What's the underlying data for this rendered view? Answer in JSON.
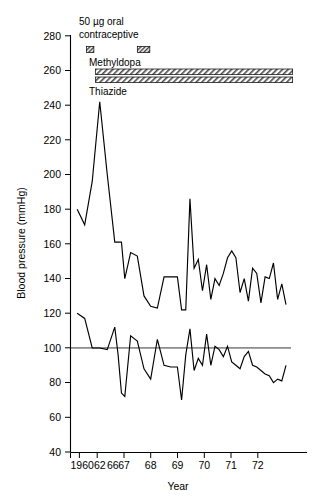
{
  "chart_data": {
    "type": "line",
    "title": "",
    "xlabel": "Year",
    "ylabel": "Blood pressure (mmHg)",
    "ylim": [
      40,
      280
    ],
    "ytick_step": 20,
    "yticks": [
      40,
      60,
      80,
      100,
      120,
      140,
      160,
      180,
      200,
      220,
      240,
      260,
      280
    ],
    "ytick_labels": [
      "40",
      "60",
      "80",
      "100",
      "120",
      "140",
      "160",
      "180",
      "200",
      "220",
      "240",
      "260",
      "280"
    ],
    "xticks": [
      1960,
      1962,
      1966,
      1967,
      1968,
      1969,
      1970,
      1971,
      1972
    ],
    "xtick_labels": [
      "1960",
      "62",
      "66",
      "67",
      "68",
      "69",
      "70",
      "71",
      "72"
    ],
    "xlim": [
      1959.6,
      1972.8
    ],
    "grid": false,
    "legend_position": "none",
    "reference_lines": [
      {
        "name": "diastolic-target",
        "y": 100,
        "label": ""
      }
    ],
    "series": [
      {
        "name": "Systolic blood pressure",
        "x": [
          1960.0,
          1960.45,
          1960.9,
          1961.35,
          1961.8,
          1962.25,
          1962.45,
          1962.65,
          1962.85,
          1963.2,
          1963.6,
          1964.0,
          1964.4,
          1964.8,
          1965.2,
          1965.6,
          1966.0,
          1966.25,
          1966.5,
          1966.75,
          1967.0,
          1967.25,
          1967.5,
          1967.75,
          1968.0,
          1968.25,
          1968.5,
          1968.75,
          1969.0,
          1969.25,
          1969.5,
          1969.75,
          1970.0,
          1970.25,
          1970.5,
          1970.75,
          1971.0,
          1971.25,
          1971.5,
          1971.75,
          1972.0,
          1972.25,
          1972.5
        ],
        "values": [
          180,
          171,
          196,
          242,
          200,
          161,
          161,
          161,
          140,
          155,
          153,
          130,
          124,
          123,
          141,
          141,
          141,
          122,
          122,
          186,
          146,
          151,
          133,
          148,
          128,
          140,
          136,
          143,
          152,
          156,
          152,
          132,
          140,
          127,
          146,
          143,
          126,
          141,
          140,
          149,
          128,
          137,
          125
        ],
        "units": "mmHg"
      },
      {
        "name": "Diastolic blood pressure",
        "x": [
          1960.0,
          1960.45,
          1960.9,
          1961.35,
          1961.8,
          1962.25,
          1962.45,
          1962.65,
          1962.85,
          1963.2,
          1963.6,
          1964.0,
          1964.4,
          1964.8,
          1965.2,
          1965.6,
          1966.0,
          1966.25,
          1966.5,
          1966.75,
          1967.0,
          1967.25,
          1967.5,
          1967.75,
          1968.0,
          1968.25,
          1968.5,
          1968.75,
          1969.0,
          1969.25,
          1969.5,
          1969.75,
          1970.0,
          1970.25,
          1970.5,
          1970.75,
          1971.0,
          1971.25,
          1971.5,
          1971.75,
          1972.0,
          1972.25,
          1972.5
        ],
        "values": [
          120,
          117,
          100,
          100,
          99,
          112,
          96,
          74,
          72,
          107,
          104,
          88,
          82,
          105,
          90,
          89,
          89,
          70,
          96,
          111,
          87,
          94,
          90,
          108,
          90,
          101,
          99,
          95,
          101,
          92,
          90,
          88,
          95,
          98,
          90,
          89,
          87,
          85,
          84,
          80,
          82,
          81,
          90
        ],
        "units": "mmHg"
      }
    ],
    "annotations": [
      {
        "name": "oral-contraceptive",
        "label": "50 µg oral contraceptive",
        "label_lines": [
          "50 µg oral",
          "contraceptive"
        ],
        "style": "hatched-box",
        "periods": [
          {
            "x_start": 1960.55,
            "x_end": 1961.0
          },
          {
            "x_start": 1963.6,
            "x_end": 1964.35
          }
        ]
      },
      {
        "name": "methyldopa",
        "label": "Methyldopa",
        "style": "hatched-bar",
        "x_start": 1961.1,
        "x_end": 1972.9
      },
      {
        "name": "thiazide",
        "label": "Thiazide",
        "style": "hatched-bar",
        "x_start": 1961.1,
        "x_end": 1972.9
      }
    ]
  }
}
